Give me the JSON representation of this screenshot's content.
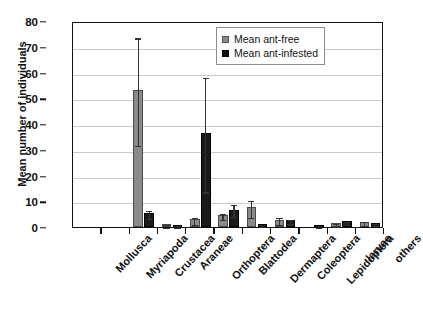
{
  "chart_data": {
    "type": "bar",
    "title": "",
    "xlabel": "",
    "ylabel": "Mean number of individuals",
    "ylim": [
      0,
      80
    ],
    "ytick_step": 10,
    "yticks": [
      "0",
      "10",
      "20",
      "30",
      "40",
      "50",
      "60",
      "70",
      "80"
    ],
    "grid": "horizontal",
    "legend_position": "top-right",
    "categories": [
      "Mollusca",
      "Myriapoda",
      "Crustacea",
      "Araneae",
      "Orthoptera",
      "Blattodea",
      "Dermaptera",
      "Coleoptera",
      "Lepidoptera",
      "larvae",
      "others"
    ],
    "series": [
      {
        "name": "Mean ant-free",
        "color": "#8a8a8a",
        "values": [
          0,
          0,
          53.2,
          1.0,
          3.0,
          4.5,
          7.7,
          2.9,
          0.0,
          1.5,
          1.8
        ],
        "err_low": [
          0,
          0,
          32.2,
          0.6,
          1.6,
          3.4,
          4.3,
          1.7,
          0.0,
          1.0,
          1.2
        ],
        "err_high": [
          0,
          0,
          74.0,
          1.6,
          4.4,
          5.8,
          11.0,
          4.3,
          0.0,
          2.1,
          2.6
        ]
      },
      {
        "name": "Mean ant-infested",
        "color": "#1a1a1a",
        "values": [
          0,
          0,
          5.4,
          0.7,
          36.4,
          6.7,
          1.2,
          2.6,
          0.9,
          2.3,
          1.5
        ],
        "err_low": [
          0,
          0,
          3.9,
          0.4,
          14.2,
          4.6,
          0.8,
          1.8,
          0.6,
          1.7,
          1.1
        ],
        "err_high": [
          0,
          0,
          7.0,
          1.1,
          58.6,
          9.3,
          1.7,
          3.4,
          1.2,
          2.9,
          2.0
        ]
      }
    ]
  },
  "legend": {
    "items": [
      {
        "label": "Mean ant-free"
      },
      {
        "label": "Mean ant-infested"
      }
    ]
  }
}
